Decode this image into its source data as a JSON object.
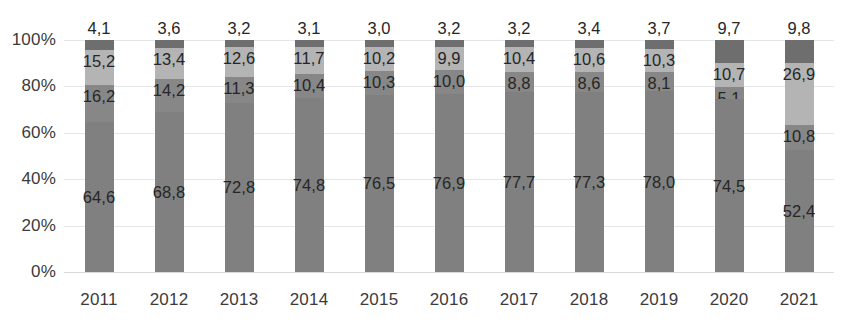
{
  "chart_data": {
    "type": "bar",
    "subtype": "stacked-100-percent",
    "title": "",
    "subtitle": "",
    "xlabel": "",
    "ylabel": "",
    "grid": true,
    "legend": "none",
    "ylim": [
      0,
      100
    ],
    "yticks": [
      "0%",
      "20%",
      "40%",
      "60%",
      "80%",
      "100%"
    ],
    "ytick_values": [
      0,
      20,
      40,
      60,
      80,
      100
    ],
    "categories": [
      "2011",
      "2012",
      "2013",
      "2014",
      "2015",
      "2016",
      "2017",
      "2018",
      "2019",
      "2020",
      "2021"
    ],
    "decimal_separator": ",",
    "series": [
      {
        "name": "series-1-bottom",
        "color": "#808080",
        "values": [
          64.6,
          68.8,
          72.8,
          74.8,
          76.5,
          76.9,
          77.7,
          77.3,
          78.0,
          74.5,
          52.4
        ],
        "labels": [
          "64,6",
          "68,8",
          "72,8",
          "74,8",
          "76,5",
          "76,9",
          "77,7",
          "77,3",
          "78,0",
          "74,5",
          "52,4"
        ]
      },
      {
        "name": "series-2",
        "color": "#878787",
        "values": [
          16.2,
          14.2,
          11.3,
          10.4,
          10.3,
          10.0,
          8.8,
          8.6,
          8.1,
          5.1,
          10.8
        ],
        "labels": [
          "16,2",
          "14,2",
          "11,3",
          "10,4",
          "10,3",
          "10,0",
          "8,8",
          "8,6",
          "8,1",
          "5,1",
          "10,8"
        ]
      },
      {
        "name": "series-3",
        "color": "#b4b4b4",
        "values": [
          15.2,
          13.4,
          12.6,
          11.7,
          10.2,
          9.9,
          10.4,
          10.6,
          10.3,
          10.7,
          26.9
        ],
        "labels": [
          "15,2",
          "13,4",
          "12,6",
          "11,7",
          "10,2",
          "9,9",
          "10,4",
          "10,6",
          "10,3",
          "10,7",
          "26,9"
        ]
      },
      {
        "name": "series-4-top",
        "color": "#6e6e6e",
        "values": [
          4.1,
          3.6,
          3.2,
          3.1,
          3.0,
          3.2,
          3.2,
          3.4,
          3.7,
          9.7,
          9.8
        ],
        "labels": [
          "4,1",
          "3,6",
          "3,2",
          "3,1",
          "3,0",
          "3,2",
          "3,2",
          "3,4",
          "3,7",
          "9,7",
          "9,8"
        ]
      }
    ]
  },
  "colors": {
    "gridline": "#e4e6e8",
    "baseline": "#d8dadc",
    "tick_text": "#3b3b3b",
    "label_text": "#262626",
    "background": "#ffffff"
  }
}
